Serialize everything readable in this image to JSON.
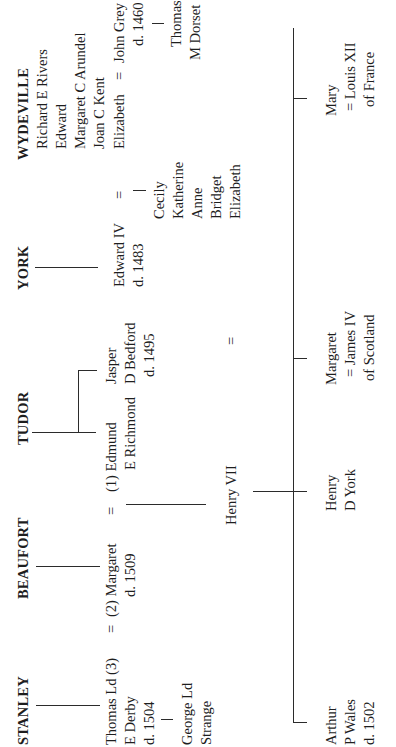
{
  "chart_title": "Genealogy of the Tudor succession",
  "families": {
    "stanley": "STANLEY",
    "beaufort": "BEAUFORT",
    "tudor": "TUDOR",
    "york": "YORK",
    "wydeville": "WYDEVILLE"
  },
  "stanley": {
    "thomas_line1": "Thomas Ld (3)",
    "thomas_line2": "E Derby",
    "thomas_line3": "d. 1504",
    "marriage_sign": "=",
    "george_line1": "George Ld",
    "george_line2": "Strange"
  },
  "beaufort": {
    "margaret_line1": "(2) Margaret",
    "margaret_line2": "d. 1509",
    "marriage_sign": "="
  },
  "tudor": {
    "edmund_line1": "(1) Edmund",
    "edmund_line2": "E Richmond",
    "jasper_line1": "Jasper",
    "jasper_line2": "D Bedford",
    "jasper_line3": "d. 1495"
  },
  "henry_vii": {
    "name": "Henry VII",
    "marriage_sign": "="
  },
  "york": {
    "edward_line1": "Edward IV",
    "edward_line2": "d. 1483",
    "marriage_sign": "=",
    "daughters": [
      "Cecily",
      "Katherine",
      "Anne",
      "Bridget",
      "Elizabeth"
    ]
  },
  "wydeville": {
    "members": [
      "Richard E Rivers",
      "Edward",
      "Margaret C Arundel",
      "Joan C Kent"
    ],
    "elizabeth": "Elizabeth",
    "marriage_sign": "=",
    "john_grey_line1": "John Grey",
    "john_grey_line2": "d. 1460",
    "thomas_line1": "Thomas",
    "thomas_line2": "M Dorset"
  },
  "children": [
    {
      "line1": "Arthur",
      "line2": "P Wales",
      "line3": "d. 1502"
    },
    {
      "line1": "Henry",
      "line2": "D York"
    },
    {
      "line1": "Margaret",
      "line2": "= James IV",
      "line3": "of Scotland"
    },
    {
      "line1": "Mary",
      "line2": "= Louis XII",
      "line3": "of France"
    }
  ]
}
